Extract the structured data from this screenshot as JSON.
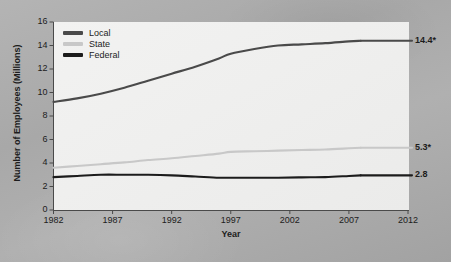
{
  "chart_data": {
    "type": "line",
    "title": "",
    "xlabel": "Year",
    "ylabel": "Number of Employees (Millions)",
    "xlim": [
      1982,
      2012
    ],
    "ylim": [
      0,
      16
    ],
    "xticks": [
      "1982",
      "1987",
      "1992",
      "1997",
      "2002",
      "2007",
      "2012"
    ],
    "yticks": [
      "0",
      "2",
      "4",
      "6",
      "8",
      "10",
      "12",
      "14",
      "16"
    ],
    "grid": false,
    "legend_position": "top-left",
    "x": [
      1982,
      1984,
      1986,
      1988,
      1990,
      1992,
      1994,
      1996,
      1997,
      1999,
      2001,
      2003,
      2005,
      2007,
      2008
    ],
    "series": [
      {
        "name": "Local",
        "color": "#4a4a4a",
        "values": [
          9.2,
          9.5,
          9.9,
          10.4,
          11.0,
          11.6,
          12.2,
          12.9,
          13.3,
          13.7,
          14.0,
          14.1,
          14.2,
          14.35,
          14.4
        ],
        "end_label": "14.4*"
      },
      {
        "name": "State",
        "color": "#c8c8c8",
        "values": [
          3.6,
          3.75,
          3.9,
          4.05,
          4.25,
          4.4,
          4.6,
          4.8,
          4.95,
          5.0,
          5.05,
          5.1,
          5.15,
          5.25,
          5.3
        ],
        "end_label": "5.3*"
      },
      {
        "name": "Federal",
        "color": "#1c1c1c",
        "values": [
          2.8,
          2.9,
          3.0,
          3.0,
          3.0,
          2.95,
          2.85,
          2.75,
          2.75,
          2.75,
          2.75,
          2.78,
          2.8,
          2.9,
          2.95
        ],
        "end_label": "2.8"
      }
    ],
    "legend": [
      "Local",
      "State",
      "Federal"
    ],
    "end_labels": [
      "14.4*",
      "5.3*",
      "2.8"
    ],
    "footnote_marker": "*"
  }
}
